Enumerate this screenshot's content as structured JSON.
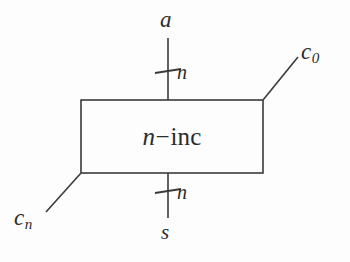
{
  "diagram": {
    "type": "block-diagram",
    "background_color": "#fdfdfd",
    "line_color": "#3a3a3a",
    "text_color": "#2b2b2b",
    "block": {
      "label_base": "n",
      "label_operator": "−",
      "label_suffix": "inc",
      "label_full": "n−inc",
      "x": 81,
      "y": 100,
      "width": 182,
      "height": 73
    },
    "ports": [
      {
        "id": "a",
        "label": "a",
        "side": "top",
        "kind": "bus",
        "bus_width_label": "n",
        "x": 168,
        "y": 38
      },
      {
        "id": "s",
        "label": "s",
        "side": "bottom",
        "kind": "bus",
        "bus_width_label": "n",
        "x": 168,
        "y": 218
      },
      {
        "id": "c0",
        "label_base": "c",
        "label_sub": "0",
        "label": "c0",
        "side": "top-right",
        "kind": "single",
        "x": 297,
        "y": 58
      },
      {
        "id": "cn",
        "label_base": "c",
        "label_sub": "n",
        "label": "cn",
        "side": "bottom-left",
        "kind": "single",
        "x": 47,
        "y": 211
      }
    ],
    "bus_ticks": [
      {
        "id": "tick-top",
        "label": "n",
        "x": 168,
        "y": 71
      },
      {
        "id": "tick-bottom",
        "label": "n",
        "x": 168,
        "y": 191
      }
    ]
  }
}
